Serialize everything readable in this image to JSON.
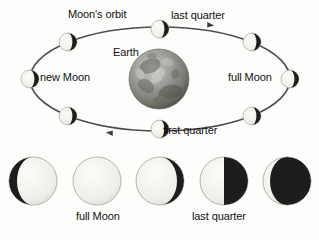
{
  "figure": {
    "background_color": "#fdfdfc",
    "text_color": "#111111",
    "dark_color": "#1a1a1a",
    "light_color": "#f2f2ee",
    "orbit_stroke": "#4a4a4a",
    "earth_color": "#8c8c8c"
  },
  "labels": {
    "moons_orbit": "Moon's orbit",
    "last_quarter_top": "last quarter",
    "earth": "Earth",
    "new_moon": "new Moon",
    "full_moon": "full Moon",
    "first_quarter": "first quarter",
    "full_moon_bottom": "full Moon",
    "last_quarter_bottom": "last quarter"
  },
  "orbit": {
    "center_x": 160,
    "center_y": 79,
    "radius_x": 130,
    "radius_y": 52,
    "direction": "counterclockwise",
    "arrow_count": 2,
    "moon_positions": [
      {
        "name": "new-moon",
        "x": 30,
        "y": 79,
        "lit_side": "left",
        "illumination": 0.5
      },
      {
        "name": "waxing-upper-left",
        "x": 68,
        "y": 42,
        "lit_side": "left",
        "illumination": 0.5
      },
      {
        "name": "last-quarter-top",
        "x": 160,
        "y": 29,
        "lit_side": "left",
        "illumination": 0.5
      },
      {
        "name": "waning-upper-right",
        "x": 252,
        "y": 42,
        "lit_side": "left",
        "illumination": 0.5
      },
      {
        "name": "full-moon",
        "x": 290,
        "y": 79,
        "lit_side": "left",
        "illumination": 0.5
      },
      {
        "name": "waning-lower-right",
        "x": 252,
        "y": 116,
        "lit_side": "left",
        "illumination": 0.5
      },
      {
        "name": "first-quarter-bottom",
        "x": 160,
        "y": 129,
        "lit_side": "left",
        "illumination": 0.5
      },
      {
        "name": "waxing-lower-left",
        "x": 68,
        "y": 116,
        "lit_side": "left",
        "illumination": 0.5
      }
    ]
  },
  "phase_row": {
    "count": 5,
    "moons": [
      {
        "name": "waxing-gibbous",
        "x": 33,
        "y": 181,
        "r": 24,
        "dark_side": "left",
        "dark_fraction": 0.18
      },
      {
        "name": "full-moon",
        "x": 97,
        "y": 181,
        "r": 24,
        "dark_side": "none",
        "dark_fraction": 0.0
      },
      {
        "name": "waning-gibbous",
        "x": 160,
        "y": 181,
        "r": 24,
        "dark_side": "right",
        "dark_fraction": 0.15
      },
      {
        "name": "last-quarter",
        "x": 224,
        "y": 181,
        "r": 24,
        "dark_side": "right",
        "dark_fraction": 0.5
      },
      {
        "name": "waning-crescent",
        "x": 287,
        "y": 181,
        "r": 24,
        "dark_side": "right",
        "dark_fraction": 0.85
      }
    ]
  }
}
